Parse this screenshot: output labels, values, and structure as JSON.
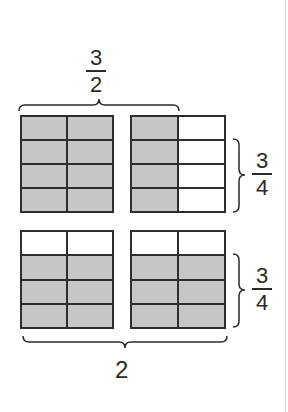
{
  "diagram": {
    "top_label": {
      "numerator": "3",
      "denominator": "2"
    },
    "right_top_label": {
      "numerator": "3",
      "denominator": "4"
    },
    "right_bottom_label": {
      "numerator": "3",
      "denominator": "4"
    },
    "bottom_label": "2",
    "colors": {
      "shaded": "#c6c6c6",
      "unshaded": "#ffffff",
      "grid_line": "#2e2e2e"
    },
    "grids": [
      {
        "name": "top-left",
        "rows": 4,
        "cols": 2,
        "shaded": [
          [
            1,
            1
          ],
          [
            1,
            1
          ],
          [
            1,
            1
          ],
          [
            1,
            1
          ]
        ]
      },
      {
        "name": "top-right",
        "rows": 4,
        "cols": 2,
        "shaded": [
          [
            1,
            0
          ],
          [
            1,
            0
          ],
          [
            1,
            0
          ],
          [
            1,
            0
          ]
        ]
      },
      {
        "name": "bottom-left",
        "rows": 4,
        "cols": 2,
        "shaded": [
          [
            0,
            0
          ],
          [
            1,
            1
          ],
          [
            1,
            1
          ],
          [
            1,
            1
          ]
        ]
      },
      {
        "name": "bottom-right",
        "rows": 4,
        "cols": 2,
        "shaded": [
          [
            0,
            0
          ],
          [
            1,
            1
          ],
          [
            1,
            1
          ],
          [
            1,
            1
          ]
        ]
      }
    ]
  }
}
